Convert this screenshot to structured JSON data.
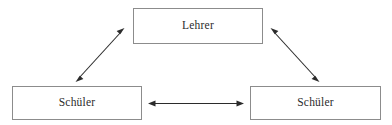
{
  "diagram": {
    "title": "",
    "background_color": "#ffffff",
    "node_border_color": "#8c8c8c",
    "node_fill_color": "#ffffff",
    "edge_color": "#2b2b2b",
    "text_color": "#2b2b2b",
    "nodes": [
      {
        "id": "teacher",
        "label": "Lehrer",
        "shape": "rectangle",
        "position": "top-center"
      },
      {
        "id": "student-left",
        "label": "Schüler",
        "shape": "rectangle",
        "position": "bottom-left"
      },
      {
        "id": "student-right",
        "label": "Schüler",
        "shape": "rectangle",
        "position": "bottom-right"
      }
    ],
    "edges": [
      {
        "id": "edge-teacher-student-left",
        "from": "student-left",
        "to": "teacher",
        "label": "",
        "style": "double-headed-arrow",
        "orientation": "diagonal-up-right"
      },
      {
        "id": "edge-teacher-student-right",
        "from": "teacher",
        "to": "student-right",
        "label": "",
        "style": "double-headed-arrow",
        "orientation": "diagonal-down-right"
      },
      {
        "id": "edge-student-left-student-right",
        "from": "student-left",
        "to": "student-right",
        "label": "",
        "style": "double-headed-arrow",
        "orientation": "horizontal"
      }
    ]
  }
}
